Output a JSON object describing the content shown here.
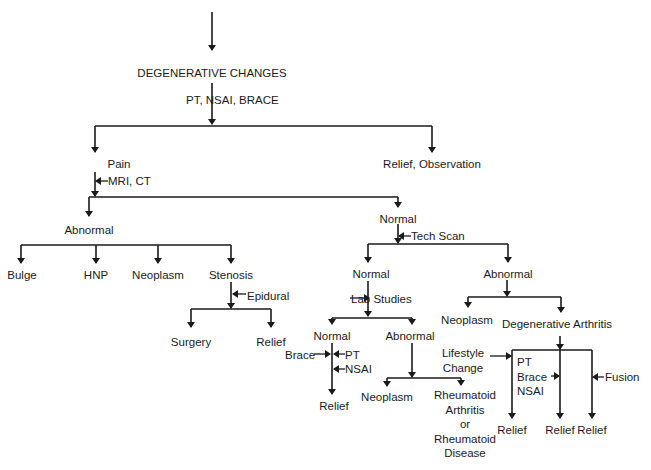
{
  "diagram": {
    "title": "DEGENERATIVE CHANGES",
    "line_color": "#1a1a1a",
    "text_color": "#1a1a1a",
    "nodes": [
      {
        "id": "degenerative-changes",
        "label": "DEGENERATIVE CHANGES",
        "x": 212,
        "y": 67,
        "align": "center"
      },
      {
        "id": "pain",
        "label": "Pain",
        "x": 119,
        "y": 158,
        "align": "center"
      },
      {
        "id": "relief-observation",
        "label": "Relief, Observation",
        "x": 432,
        "y": 158,
        "align": "center"
      },
      {
        "id": "abnormal-1",
        "label": "Abnormal",
        "x": 89,
        "y": 224,
        "align": "center"
      },
      {
        "id": "normal-1",
        "label": "Normal",
        "x": 398,
        "y": 213,
        "align": "center"
      },
      {
        "id": "bulge",
        "label": "Bulge",
        "x": 22,
        "y": 269,
        "align": "center"
      },
      {
        "id": "hnp",
        "label": "HNP",
        "x": 96,
        "y": 269,
        "align": "center"
      },
      {
        "id": "neoplasm-1",
        "label": "Neoplasm",
        "x": 158,
        "y": 269,
        "align": "center"
      },
      {
        "id": "stenosis",
        "label": "Stenosis",
        "x": 231,
        "y": 269,
        "align": "center"
      },
      {
        "id": "surgery",
        "label": "Surgery",
        "x": 191,
        "y": 336,
        "align": "center"
      },
      {
        "id": "relief-1",
        "label": "Relief",
        "x": 271,
        "y": 336,
        "align": "center"
      },
      {
        "id": "normal-2",
        "label": "Normal",
        "x": 371,
        "y": 268,
        "align": "center"
      },
      {
        "id": "abnormal-2",
        "label": "Abnormal",
        "x": 508,
        "y": 268,
        "align": "center"
      },
      {
        "id": "normal-3",
        "label": "Normal",
        "x": 332,
        "y": 330,
        "align": "center"
      },
      {
        "id": "abnormal-3",
        "label": "Abnormal",
        "x": 410,
        "y": 330,
        "align": "center"
      },
      {
        "id": "neoplasm-2",
        "label": "Neoplasm",
        "x": 467,
        "y": 314,
        "align": "center"
      },
      {
        "id": "degenerative-arthritis",
        "label": "Degenerative Arthritis",
        "x": 557,
        "y": 318,
        "align": "center"
      },
      {
        "id": "relief-2",
        "label": "Relief",
        "x": 334,
        "y": 400,
        "align": "center"
      },
      {
        "id": "neoplasm-3",
        "label": "Neoplasm",
        "x": 387,
        "y": 391,
        "align": "center"
      },
      {
        "id": "rheumatoid",
        "label": "Rheumatoid\nArthritis\nor\nRheumatoid\nDisease",
        "x": 465,
        "y": 388,
        "align": "multi"
      },
      {
        "id": "relief-3",
        "label": "Relief",
        "x": 512,
        "y": 424,
        "align": "center"
      },
      {
        "id": "relief-4",
        "label": "Relief",
        "x": 560,
        "y": 424,
        "align": "center"
      },
      {
        "id": "relief-5",
        "label": "Relief",
        "x": 592,
        "y": 424,
        "align": "center"
      }
    ],
    "annotations": [
      {
        "id": "pt-nsai-brace",
        "label": "PT, NSAI, BRACE",
        "x": 186,
        "y": 94
      },
      {
        "id": "mri-ct",
        "label": "MRI, CT",
        "x": 108,
        "y": 175
      },
      {
        "id": "tech-scan",
        "label": "Tech Scan",
        "x": 411,
        "y": 230
      },
      {
        "id": "epidural",
        "label": "Epidural",
        "x": 247,
        "y": 290
      },
      {
        "id": "lab-studies",
        "label": "Lab Studies",
        "x": 351,
        "y": 293
      },
      {
        "id": "brace-left",
        "label": "Brace",
        "x": 285,
        "y": 349
      },
      {
        "id": "pt-right",
        "label": "PT",
        "x": 345,
        "y": 349
      },
      {
        "id": "nsai-right",
        "label": "NSAI",
        "x": 345,
        "y": 363
      },
      {
        "id": "lifestyle-change",
        "label": "Lifestyle\nChange",
        "x": 443,
        "y": 346
      },
      {
        "id": "pt-brace-nsai",
        "label": "PT\nBrace\nNSAI",
        "x": 517,
        "y": 355
      },
      {
        "id": "fusion",
        "label": "Fusion",
        "x": 605,
        "y": 371
      }
    ],
    "edges": [
      {
        "path": "M212,12 L212,50",
        "arrow": true
      },
      {
        "path": "M212,83 L212,124",
        "arrow": true
      },
      {
        "path": "M95,126 L432,126"
      },
      {
        "path": "M95,126 L95,152",
        "arrow": true
      },
      {
        "path": "M432,126 L432,152",
        "arrow": true
      },
      {
        "path": "M95,172 L95,196",
        "arrow": true
      },
      {
        "path": "M89,197 L398,197"
      },
      {
        "path": "M89,197 L89,216",
        "arrow": true
      },
      {
        "path": "M398,197 L398,207",
        "arrow": true
      },
      {
        "path": "M21,245 L231,245"
      },
      {
        "path": "M21,245 L21,263",
        "arrow": true
      },
      {
        "path": "M96,245 L96,263",
        "arrow": true
      },
      {
        "path": "M158,245 L158,263",
        "arrow": true
      },
      {
        "path": "M231,245 L231,263",
        "arrow": true
      },
      {
        "path": "M231,282 L231,308",
        "arrow": true
      },
      {
        "path": "M191,309 L271,309"
      },
      {
        "path": "M191,309 L191,327",
        "arrow": true
      },
      {
        "path": "M271,309 L271,327",
        "arrow": true
      },
      {
        "path": "M398,224 L398,243",
        "arrow": true
      },
      {
        "path": "M368,244 L508,244"
      },
      {
        "path": "M368,244 L368,262",
        "arrow": true
      },
      {
        "path": "M508,244 L508,262",
        "arrow": true
      },
      {
        "path": "M368,281 L368,316",
        "arrow": true
      },
      {
        "path": "M332,318 L412,318"
      },
      {
        "path": "M332,318 L332,324",
        "arrow": true
      },
      {
        "path": "M412,318 L412,324",
        "arrow": true
      },
      {
        "path": "M507,280 L507,296",
        "arrow": true
      },
      {
        "path": "M468,297 L561,297"
      },
      {
        "path": "M468,297 L468,307",
        "arrow": true
      },
      {
        "path": "M561,297 L561,312",
        "arrow": true
      },
      {
        "path": "M332,343 L332,394",
        "arrow": true
      },
      {
        "path": "M412,343 L412,377",
        "arrow": true
      },
      {
        "path": "M387,378 L461,378"
      },
      {
        "path": "M387,378 L387,386",
        "arrow": true
      },
      {
        "path": "M461,378 L461,385",
        "arrow": true
      },
      {
        "path": "M560,336 L560,349",
        "arrow": true
      },
      {
        "path": "M512,350 L592,350"
      },
      {
        "path": "M512,350 L512,418",
        "arrow": true
      },
      {
        "path": "M560,350 L560,418",
        "arrow": true
      },
      {
        "path": "M592,350 L592,418",
        "arrow": true
      }
    ],
    "side_arrows": [
      {
        "from_x": 108,
        "to_x": 96,
        "y": 181
      },
      {
        "from_x": 411,
        "to_x": 399,
        "y": 236
      },
      {
        "from_x": 246,
        "to_x": 233,
        "y": 294
      },
      {
        "from_x": 350,
        "to_x": 369,
        "y": 298,
        "dir": "left"
      },
      {
        "from_x": 314,
        "to_x": 330,
        "y": 354,
        "dir": "right"
      },
      {
        "from_x": 345,
        "to_x": 334,
        "y": 354
      },
      {
        "from_x": 345,
        "to_x": 334,
        "y": 369
      },
      {
        "from_x": 490,
        "to_x": 511,
        "y": 356,
        "dir": "right"
      },
      {
        "from_x": 551,
        "to_x": 559,
        "y": 376,
        "dir": "right"
      },
      {
        "from_x": 604,
        "to_x": 593,
        "y": 377
      }
    ]
  }
}
